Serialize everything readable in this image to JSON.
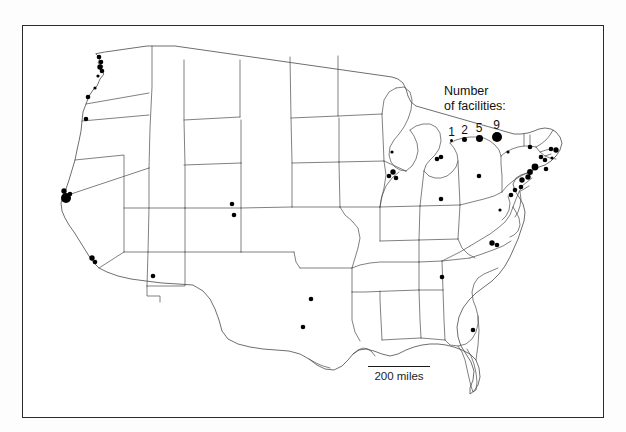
{
  "figure": {
    "kind": "thematic-dot-map",
    "region": "United States (contiguous 48 states)",
    "background_color": "#ffffff",
    "frame_color": "#2b2b2b",
    "outline_color": "#4a4a4a",
    "symbol_color": "#000000"
  },
  "legend": {
    "title_line_1": "Number",
    "title_line_2": "of facilities:",
    "classes": [
      {
        "label": "1",
        "radius": 1.6
      },
      {
        "label": "2",
        "radius": 2.3
      },
      {
        "label": "5",
        "radius": 3.4
      },
      {
        "label": "9",
        "radius": 5.0
      }
    ]
  },
  "scale": {
    "label": "200 miles",
    "bar_length_px": 62
  },
  "chart_data": {
    "type": "scatter",
    "title": "",
    "xlabel": "",
    "ylabel": "",
    "legend_title": "Number of facilities:",
    "legend_entries": [
      "1",
      "2",
      "5",
      "9"
    ],
    "annotations": [
      "200 miles"
    ],
    "value_to_radius": {
      "1": 1.6,
      "2": 2.3,
      "5": 3.4,
      "9": 5.0
    },
    "points": [
      {
        "place": "Puget Sound WA",
        "x": 99,
        "y": 57,
        "value": 2
      },
      {
        "place": "Puget Sound WA 2",
        "x": 101,
        "y": 62,
        "value": 2
      },
      {
        "place": "Seattle WA",
        "x": 100,
        "y": 67,
        "value": 3
      },
      {
        "place": "Tacoma WA",
        "x": 102,
        "y": 71,
        "value": 2
      },
      {
        "place": "Olympia WA",
        "x": 98,
        "y": 76,
        "value": 1
      },
      {
        "place": "Vancouver WA",
        "x": 95,
        "y": 88,
        "value": 1
      },
      {
        "place": "Portland OR",
        "x": 88,
        "y": 97,
        "value": 2
      },
      {
        "place": "Corvallis OR",
        "x": 86,
        "y": 119,
        "value": 2
      },
      {
        "place": "San Francisco Bay CA",
        "x": 66,
        "y": 198,
        "value": 9
      },
      {
        "place": "Bay Area north CA",
        "x": 64,
        "y": 191,
        "value": 3
      },
      {
        "place": "Bay Area east CA",
        "x": 70,
        "y": 194,
        "value": 2
      },
      {
        "place": "Los Angeles CA",
        "x": 92,
        "y": 258,
        "value": 3
      },
      {
        "place": "Los Angeles south CA",
        "x": 95,
        "y": 262,
        "value": 2
      },
      {
        "place": "Phoenix AZ",
        "x": 153,
        "y": 276,
        "value": 2
      },
      {
        "place": "Denver CO",
        "x": 232,
        "y": 204,
        "value": 2
      },
      {
        "place": "Colorado Springs CO",
        "x": 234,
        "y": 215,
        "value": 2
      },
      {
        "place": "Oklahoma OK",
        "x": 311,
        "y": 299,
        "value": 2
      },
      {
        "place": "Dallas TX",
        "x": 303,
        "y": 327,
        "value": 2
      },
      {
        "place": "Chicago IL",
        "x": 393,
        "y": 172,
        "value": 3
      },
      {
        "place": "Chicago west IL",
        "x": 389,
        "y": 176,
        "value": 2
      },
      {
        "place": "Chicago south IL",
        "x": 396,
        "y": 178,
        "value": 2
      },
      {
        "place": "Detroit MI",
        "x": 437,
        "y": 159,
        "value": 2
      },
      {
        "place": "Detroit east MI",
        "x": 441,
        "y": 157,
        "value": 2
      },
      {
        "place": "Columbus OH",
        "x": 441,
        "y": 199,
        "value": 2
      },
      {
        "place": "Atlanta GA",
        "x": 442,
        "y": 277,
        "value": 2
      },
      {
        "place": "Research Triangle NC",
        "x": 492,
        "y": 243,
        "value": 3
      },
      {
        "place": "Raleigh NC",
        "x": 497,
        "y": 245,
        "value": 2
      },
      {
        "place": "Orlando FL",
        "x": 473,
        "y": 330,
        "value": 2
      },
      {
        "place": "Pittsburgh PA",
        "x": 479,
        "y": 176,
        "value": 2
      },
      {
        "place": "Boston MA",
        "x": 556,
        "y": 150,
        "value": 3
      },
      {
        "place": "Boston west MA",
        "x": 551,
        "y": 149,
        "value": 2
      },
      {
        "place": "Connecticut CT",
        "x": 545,
        "y": 160,
        "value": 2
      },
      {
        "place": "Hartford CT",
        "x": 541,
        "y": 157,
        "value": 2
      },
      {
        "place": "Albany NY",
        "x": 530,
        "y": 147,
        "value": 2
      },
      {
        "place": "New York NY",
        "x": 535,
        "y": 167,
        "value": 5
      },
      {
        "place": "Northern NJ",
        "x": 530,
        "y": 172,
        "value": 4
      },
      {
        "place": "Central NJ",
        "x": 528,
        "y": 177,
        "value": 3
      },
      {
        "place": "Philadelphia PA",
        "x": 522,
        "y": 180,
        "value": 3
      },
      {
        "place": "Delaware DE",
        "x": 521,
        "y": 187,
        "value": 2
      },
      {
        "place": "Baltimore MD",
        "x": 515,
        "y": 190,
        "value": 2
      },
      {
        "place": "Washington DC",
        "x": 511,
        "y": 195,
        "value": 2
      },
      {
        "place": "Long Island NY",
        "x": 546,
        "y": 169,
        "value": 2
      },
      {
        "place": "Rhode Island RI",
        "x": 552,
        "y": 158,
        "value": 1
      },
      {
        "place": "Upstate NY",
        "x": 508,
        "y": 152,
        "value": 1
      },
      {
        "place": "Michigan west MI",
        "x": 392,
        "y": 152,
        "value": 1
      },
      {
        "place": "Virginia VA",
        "x": 500,
        "y": 210,
        "value": 1
      }
    ]
  }
}
